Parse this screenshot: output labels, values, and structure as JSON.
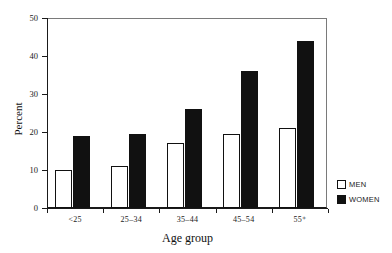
{
  "chart_data": {
    "type": "bar",
    "title": "",
    "subtitle": "",
    "xlabel": "Age group",
    "ylabel": "Percent",
    "categories": [
      "<25",
      "25–34",
      "35–44",
      "45–54",
      "55⁺"
    ],
    "series": [
      {
        "name": "MEN",
        "color": "#ffffff",
        "values": [
          10,
          11,
          17,
          19.5,
          21
        ]
      },
      {
        "name": "WOMEN",
        "color": "#111111",
        "values": [
          19,
          19.5,
          26,
          36,
          44
        ]
      }
    ],
    "ylim": [
      0,
      50
    ],
    "yticks": [
      0,
      10,
      20,
      30,
      40,
      50
    ],
    "ytick_labels": [
      "0",
      "10",
      "20",
      "30",
      "40",
      "50"
    ],
    "grid": false,
    "legend_position": "right",
    "legend": [
      {
        "label": "MEN",
        "swatch": "white-square"
      },
      {
        "label": "WOMEN",
        "swatch": "black-square"
      }
    ]
  },
  "colors": {
    "axis": "#1a1a1a",
    "frame": "#7a7a7a",
    "bar_men": "#ffffff",
    "bar_women": "#111111",
    "bar_outline": "#111111",
    "bar_depth": "#8d8d8d",
    "background": "#ffffff"
  }
}
